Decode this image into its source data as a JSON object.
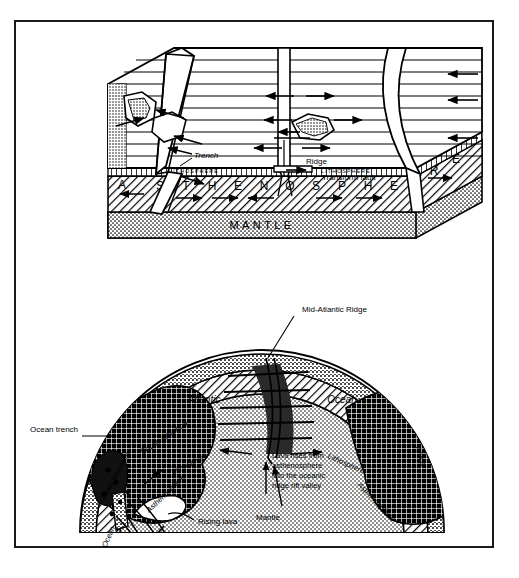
{
  "figure": {
    "frame_color": "#1a1a1a",
    "background_color": "#ffffff"
  },
  "block_diagram": {
    "name": "upper-block-diagram",
    "labels": {
      "trench": "Trench",
      "ridge": "Ridge",
      "transform_fault": "Transform fault",
      "lithosphere_left": "LITHOSPHERE",
      "lithosphere_right": "LITHOSPHERE",
      "asthenosphere": "ASTHENOSPHERE",
      "asthenosphere_letters": [
        "A",
        "S",
        "T",
        "H",
        "E",
        "N",
        "O",
        "S",
        "P",
        "H",
        "E",
        "R",
        "E"
      ],
      "mantle": "MANTLE"
    }
  },
  "globe_section": {
    "name": "lower-earth-cross-section",
    "labels": {
      "mid_atlantic_ridge": "Mid-Atlantic Ridge",
      "atlantic": "Atlantic",
      "ocean": "Ocean",
      "south_america": "South America",
      "andes_mountains": "Andes Mountains",
      "africa": "Africa",
      "pacific_ocean": "Pacific Ocean",
      "ocean_trench": "Ocean trench",
      "rising_lava": "Rising lava",
      "lithosphere_left": "Lithosphere",
      "lithosphere_right": "Lithosphere",
      "asthenosphere_left": "Asthenosphere",
      "asthenosphere_right": "Asthenosphere",
      "mantle": "Mantle",
      "lava_caption_line1": "Lava rises from",
      "lava_caption_line2": "asthenosphere",
      "lava_caption_line3": "into the oceanic",
      "lava_caption_line4": "ridge rift valley"
    }
  },
  "colors": {
    "ink": "#000000",
    "paper": "#ffffff",
    "hatch": "#1a1a1a",
    "stipple": "#555555"
  }
}
